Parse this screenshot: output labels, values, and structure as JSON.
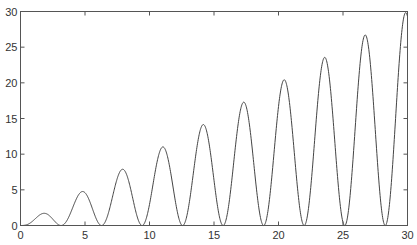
{
  "chart_data": {
    "type": "line",
    "title": "",
    "xlabel": "",
    "ylabel": "",
    "function": "y = x * sin(x)^2",
    "xlim": [
      0,
      30
    ],
    "ylim": [
      0,
      30
    ],
    "grid": false,
    "legend": null,
    "x_ticks": [
      0,
      5,
      10,
      15,
      20,
      25,
      30
    ],
    "y_ticks": [
      0,
      5,
      10,
      15,
      20,
      25,
      30
    ],
    "series": [
      {
        "name": "y",
        "color": "#444444",
        "peaks": [
          {
            "x": 1.8,
            "y": 1.6
          },
          {
            "x": 4.8,
            "y": 4.7
          },
          {
            "x": 7.9,
            "y": 7.8
          },
          {
            "x": 11.0,
            "y": 11.0
          },
          {
            "x": 14.1,
            "y": 14.1
          },
          {
            "x": 17.3,
            "y": 17.2
          },
          {
            "x": 20.4,
            "y": 20.4
          },
          {
            "x": 23.6,
            "y": 23.5
          },
          {
            "x": 26.7,
            "y": 26.7
          },
          {
            "x": 29.9,
            "y": 29.8
          }
        ],
        "zeros": [
          0,
          3.14,
          6.28,
          9.42,
          12.57,
          15.71,
          18.85,
          21.99,
          25.13,
          28.27
        ]
      }
    ]
  }
}
